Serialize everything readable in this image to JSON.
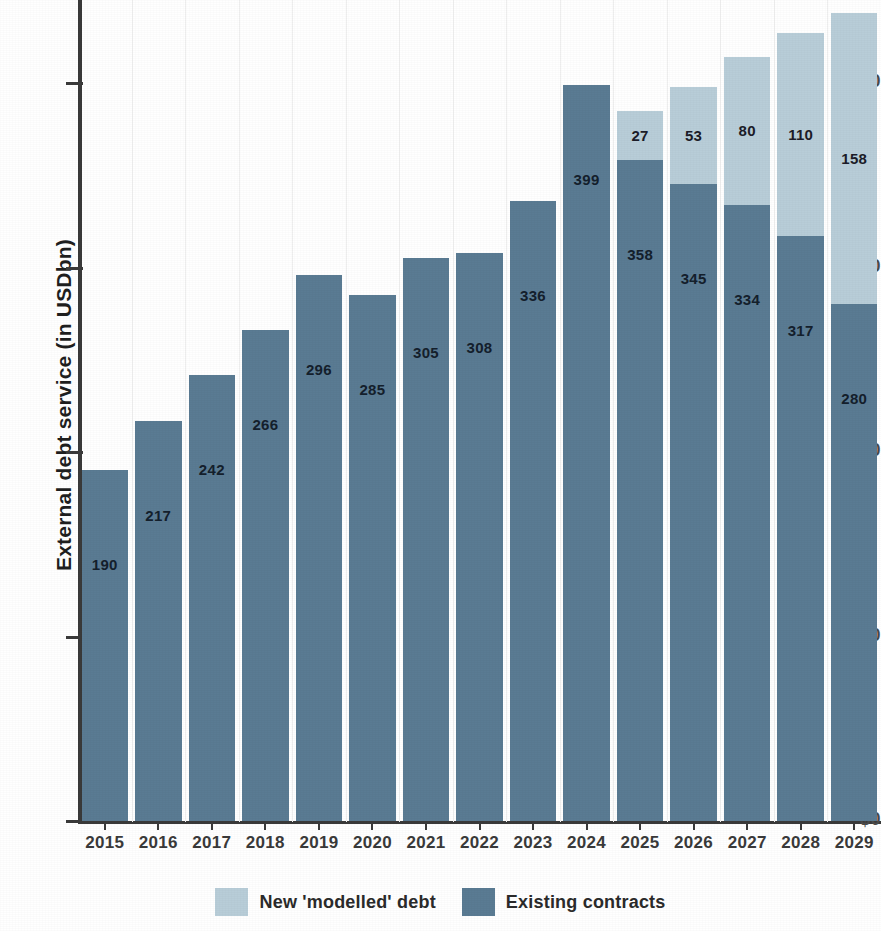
{
  "chart_data": {
    "type": "bar",
    "subtype": "stacked-vertical",
    "title": "",
    "xlabel": "",
    "ylabel": "External debt service (in USDbn)",
    "categories": [
      "2015",
      "2016",
      "2017",
      "2018",
      "2019",
      "2020",
      "2021",
      "2022",
      "2023",
      "2024",
      "2025",
      "2026",
      "2027",
      "2028",
      "2029"
    ],
    "series": [
      {
        "name": "Existing contracts",
        "color": "#5a7b93",
        "values": [
          190,
          217,
          242,
          266,
          296,
          285,
          305,
          308,
          336,
          399,
          358,
          345,
          334,
          317,
          280
        ]
      },
      {
        "name": "New 'modelled' debt",
        "color": "#b8cdd8",
        "values": [
          0,
          0,
          0,
          0,
          0,
          0,
          0,
          0,
          0,
          0,
          27,
          53,
          80,
          110,
          158
        ]
      }
    ],
    "ylim": [
      0,
      445
    ],
    "ytick_values": [
      0,
      100,
      200,
      300,
      400
    ],
    "ytick_labels": [
      "$0",
      "$100",
      "$200",
      "$300",
      "$400"
    ],
    "grid": "vertical-light",
    "legend_position": "bottom-center"
  },
  "axis": {
    "y_title": "External debt service (in USDbn)"
  },
  "legend": {
    "items": [
      {
        "label": "New 'modelled' debt",
        "color": "#b8cdd8"
      },
      {
        "label": "Existing contracts",
        "color": "#5a7b93"
      }
    ]
  },
  "colors": {
    "existing": "#5a7b93",
    "new_modelled": "#b8cdd8",
    "axis": "#3a3a3a",
    "background": "#ffffff",
    "gridline": "#efefef"
  }
}
